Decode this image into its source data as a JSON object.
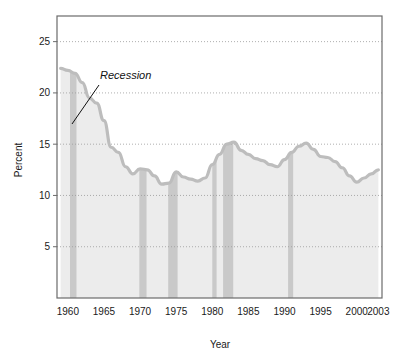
{
  "chart_data": {
    "type": "area",
    "title": "",
    "xlabel": "Year",
    "ylabel": "Percent",
    "xlim": [
      1958.5,
      2003.5
    ],
    "ylim": [
      0,
      27.5
    ],
    "grid": true,
    "legend": null,
    "x_ticks": [
      "1960",
      "1965",
      "1970",
      "1975",
      "1980",
      "1985",
      "1990",
      "1995",
      "2000",
      "2003"
    ],
    "x_tick_values": [
      1960,
      1965,
      1970,
      1975,
      1980,
      1985,
      1990,
      1995,
      2000,
      2003
    ],
    "y_ticks": [
      "5",
      "10",
      "15",
      "20",
      "25"
    ],
    "y_tick_values": [
      5,
      10,
      15,
      20,
      25
    ],
    "series": [
      {
        "name": "Percent",
        "x": [
          1959,
          1960,
          1961,
          1962,
          1963,
          1964,
          1965,
          1966,
          1967,
          1968,
          1969,
          1970,
          1971,
          1972,
          1973,
          1974,
          1975,
          1976,
          1977,
          1978,
          1979,
          1980,
          1981,
          1982,
          1983,
          1984,
          1985,
          1986,
          1987,
          1988,
          1989,
          1990,
          1991,
          1992,
          1993,
          1994,
          1995,
          1996,
          1997,
          1998,
          1999,
          2000,
          2001,
          2002,
          2003
        ],
        "values": [
          22.4,
          22.2,
          21.9,
          21.0,
          19.5,
          19.0,
          17.3,
          14.7,
          14.2,
          12.8,
          12.1,
          12.6,
          12.5,
          11.9,
          11.1,
          11.2,
          12.3,
          11.8,
          11.6,
          11.4,
          11.7,
          13.0,
          14.0,
          15.0,
          15.2,
          14.4,
          14.0,
          13.6,
          13.4,
          13.0,
          12.8,
          13.5,
          14.2,
          14.8,
          15.1,
          14.5,
          13.8,
          13.7,
          13.3,
          12.7,
          11.9,
          11.3,
          11.7,
          12.1,
          12.5
        ],
        "line_color": "#bdbdbd",
        "fill_color": "#ececec"
      }
    ],
    "recession_bands": [
      {
        "start": 1960.3,
        "end": 1961.2
      },
      {
        "start": 1969.9,
        "end": 1970.9
      },
      {
        "start": 1973.9,
        "end": 1975.2
      },
      {
        "start": 1980.0,
        "end": 1980.6
      },
      {
        "start": 1981.5,
        "end": 1982.9
      },
      {
        "start": 1990.5,
        "end": 1991.2
      }
    ],
    "recession_band_color": "#c9c9c9",
    "annotations": [
      {
        "text": "Recession",
        "text_x": 100,
        "text_y": 79,
        "leader_from_x": 99,
        "leader_from_y": 85,
        "leader_to_x": 72,
        "leader_to_y": 124
      }
    ],
    "frame_color": "#6b6b6b",
    "gridline_color": "#9a9a9a",
    "background": "#ffffff"
  },
  "figure": {
    "axis_titles": {
      "x": "Year",
      "y": "Percent"
    },
    "annotation_text": "Recession"
  }
}
